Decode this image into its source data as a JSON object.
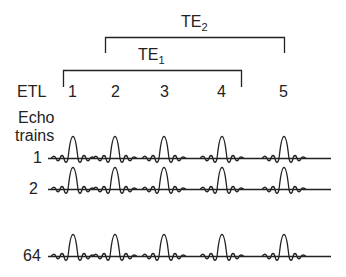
{
  "te2": {
    "label": "TE",
    "subscript": "2"
  },
  "te1": {
    "label": "TE",
    "subscript": "1"
  },
  "etl": {
    "label": "ETL",
    "numbers": [
      "1",
      "2",
      "3",
      "4",
      "5"
    ]
  },
  "echo_trains": {
    "label_line1": "Echo",
    "label_line2": "trains"
  },
  "rows": [
    {
      "label": "1"
    },
    {
      "label": "2"
    },
    {
      "label": "64"
    }
  ],
  "colors": {
    "ink": "#222222",
    "background": "#ffffff"
  }
}
